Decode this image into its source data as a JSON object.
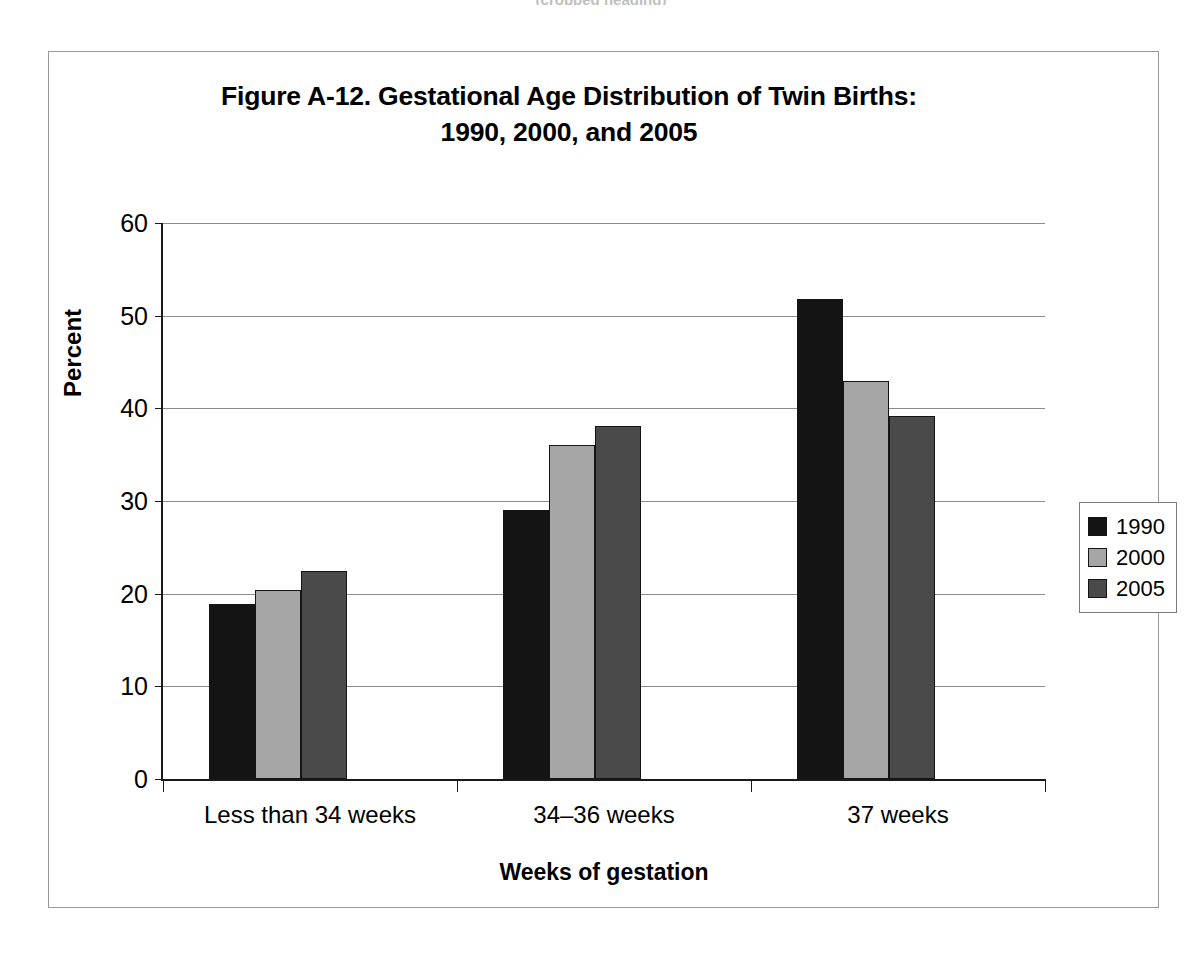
{
  "page_header": {
    "text": "(cropped heading)"
  },
  "figure": {
    "title_line1": "Figure A-12. Gestational Age Distribution of Twin Births:",
    "title_line2": "1990, 2000, and 2005"
  },
  "chart_data": {
    "type": "bar",
    "title": "Figure A-12. Gestational Age Distribution of Twin Births: 1990, 2000, and 2005",
    "xlabel": "Weeks of gestation",
    "ylabel": "Percent",
    "ylim": [
      0,
      60
    ],
    "yticks": [
      0,
      10,
      20,
      30,
      40,
      50,
      60
    ],
    "ytick_labels": [
      "0",
      "10",
      "20",
      "30",
      "40",
      "50",
      "60"
    ],
    "grid": true,
    "legend_position": "right",
    "categories": [
      "Less than 34 weeks",
      "34–36 weeks",
      "37 weeks"
    ],
    "series": [
      {
        "name": "1990",
        "color": "#141414",
        "values": [
          18.9,
          29.0,
          51.8
        ]
      },
      {
        "name": "2000",
        "color": "#a6a6a6",
        "values": [
          20.4,
          36.0,
          43.0
        ]
      },
      {
        "name": "2005",
        "color": "#4a4a4a",
        "values": [
          22.4,
          38.1,
          39.2
        ]
      }
    ]
  }
}
